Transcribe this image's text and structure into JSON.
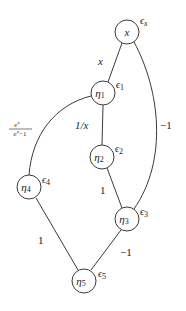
{
  "diagram": {
    "type": "computational-graph",
    "nodes": [
      {
        "id": "x",
        "label": "x",
        "sub": "",
        "eps": "ϵ",
        "eps_sub": "x",
        "cx": 127,
        "cy": 32
      },
      {
        "id": "n1",
        "label": "η",
        "sub": "1",
        "eps": "ϵ",
        "eps_sub": "1",
        "cx": 103,
        "cy": 93
      },
      {
        "id": "n2",
        "label": "η",
        "sub": "2",
        "eps": "ϵ",
        "eps_sub": "2",
        "cx": 102,
        "cy": 157
      },
      {
        "id": "n3",
        "label": "η",
        "sub": "3",
        "eps": "ϵ",
        "eps_sub": "3",
        "cx": 127,
        "cy": 219
      },
      {
        "id": "n4",
        "label": "η",
        "sub": "4",
        "eps": "ϵ",
        "eps_sub": "4",
        "cx": 29,
        "cy": 187
      },
      {
        "id": "n5",
        "label": "η",
        "sub": "5",
        "eps": "ϵ",
        "eps_sub": "5",
        "cx": 84,
        "cy": 281
      }
    ],
    "edges": [
      {
        "from": "x",
        "to": "n1",
        "weight": "x"
      },
      {
        "from": "x",
        "to": "n3",
        "weight": "−1"
      },
      {
        "from": "n1",
        "to": "n2",
        "weight": "1/x"
      },
      {
        "from": "n1",
        "to": "n4",
        "weight_num": "e^x",
        "weight_den": "e^x − 1"
      },
      {
        "from": "n2",
        "to": "n3",
        "weight": "1"
      },
      {
        "from": "n4",
        "to": "n5",
        "weight": "1"
      },
      {
        "from": "n3",
        "to": "n5",
        "weight": "−1"
      }
    ],
    "labels": {
      "x_node": "x",
      "eta": "η",
      "eps": "ϵ",
      "sub_x": "x",
      "sub_1": "1",
      "sub_2": "2",
      "sub_3": "3",
      "sub_4": "4",
      "sub_5": "5",
      "w_x_n1": "x",
      "w_x_n3": "−1",
      "w_n1_n2": "1/x",
      "w_n1_n4_num": "e",
      "w_n1_n4_num_sup": "x",
      "w_n1_n4_den": "e",
      "w_n1_n4_den_sup": "x",
      "w_n1_n4_den_tail": "−1",
      "w_n2_n3": "1",
      "w_n4_n5": "1",
      "w_n3_n5": "−1"
    }
  }
}
